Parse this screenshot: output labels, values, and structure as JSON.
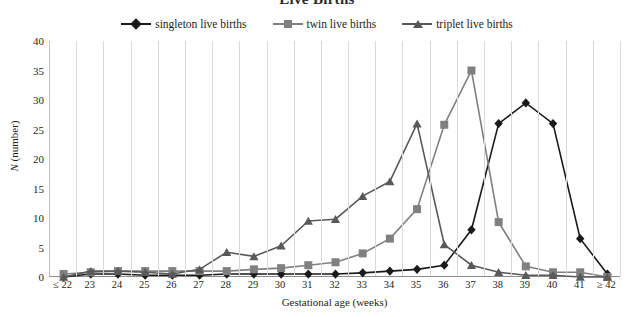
{
  "chart_data": {
    "type": "line",
    "title": "Live Births",
    "xlabel": "Gestational age (weeks)",
    "ylabel": "N (number)",
    "ylim": [
      0,
      40
    ],
    "ytick_step": 5,
    "yticks": [
      0,
      5,
      10,
      15,
      20,
      25,
      30,
      35,
      40
    ],
    "grid": "vertical",
    "legend_position": "top-center",
    "categories": [
      "≤ 22",
      "23",
      "24",
      "25",
      "26",
      "27",
      "28",
      "29",
      "30",
      "31",
      "32",
      "33",
      "34",
      "35",
      "36",
      "37",
      "38",
      "39",
      "40",
      "41",
      "≥ 42"
    ],
    "series": [
      {
        "name": "singleton live births",
        "color": "#1a1a1a",
        "marker": "diamond",
        "values": [
          0,
          0.5,
          0.5,
          0.3,
          0.3,
          0.3,
          0.5,
          0.5,
          0.5,
          0.5,
          0.5,
          0.7,
          1,
          1.3,
          2,
          8,
          26,
          29.5,
          26,
          6.5,
          0.5
        ]
      },
      {
        "name": "twin live births",
        "color": "#808080",
        "marker": "square",
        "values": [
          0.5,
          0.8,
          1,
          1,
          1,
          1,
          1,
          1.3,
          1.5,
          2,
          2.5,
          4,
          6.5,
          11.5,
          25.8,
          35,
          9.3,
          1.8,
          0.8,
          0.8,
          0
        ]
      },
      {
        "name": "triplet live births",
        "color": "#595959",
        "marker": "triangle",
        "values": [
          0,
          1,
          1,
          0.8,
          0.5,
          1.3,
          4.2,
          3.5,
          5.3,
          9.5,
          9.8,
          13.7,
          16.2,
          26,
          5.5,
          2,
          0.8,
          0.3,
          0.3,
          0,
          0
        ]
      }
    ]
  }
}
